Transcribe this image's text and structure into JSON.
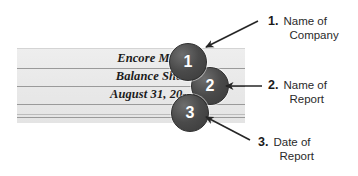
{
  "figure": {
    "type": "annotated-diagram"
  },
  "ledger": {
    "heading_lines": [
      {
        "id": "company-name",
        "text": "Encore Music"
      },
      {
        "id": "report-name",
        "text": "Balance Sheet"
      },
      {
        "id": "report-date",
        "text": "August 31, 20--"
      }
    ],
    "paper_color": "#e9e9e9",
    "rule_color": "#9a9a9a"
  },
  "callouts": [
    {
      "number": "1",
      "target": "Encore Music"
    },
    {
      "number": "2",
      "target": "Balance Sheet"
    },
    {
      "number": "3",
      "target": "August 31, 20--"
    }
  ],
  "annotations": [
    {
      "number": "1.",
      "line1": "Name of",
      "line2": "Company"
    },
    {
      "number": "2.",
      "line1": "Name of",
      "line2": "Report"
    },
    {
      "number": "3.",
      "line1": "Date of",
      "line2": "Report"
    }
  ],
  "colors": {
    "badge_fill": "#4a4a4a",
    "badge_text": "#ffffff",
    "arrow": "#262626",
    "text": "#2a2a2a",
    "background": "#ffffff"
  }
}
